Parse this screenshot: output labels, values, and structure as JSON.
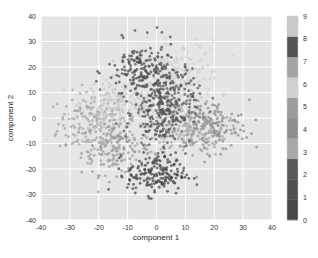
{
  "chart_data": {
    "type": "scatter",
    "title": "",
    "xlabel": "component 1",
    "ylabel": "component 2",
    "xlim": [
      -40,
      40
    ],
    "ylim": [
      -40,
      40
    ],
    "xticks": [
      -40,
      -30,
      -20,
      -10,
      0,
      10,
      20,
      30,
      40
    ],
    "yticks": [
      -40,
      -30,
      -20,
      -10,
      0,
      10,
      20,
      30,
      40
    ],
    "grid": true,
    "background": "#e5e5e5",
    "colorbar": {
      "ticks": [
        0,
        1,
        2,
        3,
        4,
        5,
        6,
        7,
        8,
        9
      ],
      "colors": [
        "#474747",
        "#4f4f4f",
        "#5a5a5a",
        "#a8a8a8",
        "#8e8e8e",
        "#9c9c9c",
        "#d0d0d0",
        "#a4a4a4",
        "#545454",
        "#c9c9c9"
      ],
      "position": "right"
    },
    "series": [
      {
        "name": "0",
        "center": [
          0,
          -22
        ],
        "spread": [
          5,
          4
        ],
        "count": 180
      },
      {
        "name": "1",
        "center": [
          -5,
          18
        ],
        "spread": [
          6,
          6
        ],
        "count": 160
      },
      {
        "name": "2",
        "center": [
          3,
          10
        ],
        "spread": [
          6,
          7
        ],
        "count": 170
      },
      {
        "name": "3",
        "center": [
          -22,
          -2
        ],
        "spread": [
          6,
          6
        ],
        "count": 170
      },
      {
        "name": "4",
        "center": [
          18,
          -3
        ],
        "spread": [
          7,
          5
        ],
        "count": 170
      },
      {
        "name": "5",
        "center": [
          -14,
          -12
        ],
        "spread": [
          6,
          5
        ],
        "count": 170
      },
      {
        "name": "6",
        "center": [
          8,
          16
        ],
        "spread": [
          7,
          7
        ],
        "count": 170
      },
      {
        "name": "7",
        "center": [
          10,
          -5
        ],
        "spread": [
          7,
          5
        ],
        "count": 170
      },
      {
        "name": "8",
        "center": [
          2,
          2
        ],
        "spread": [
          5,
          6
        ],
        "count": 170
      },
      {
        "name": "9",
        "center": [
          -12,
          6
        ],
        "spread": [
          7,
          5
        ],
        "count": 170
      }
    ]
  }
}
